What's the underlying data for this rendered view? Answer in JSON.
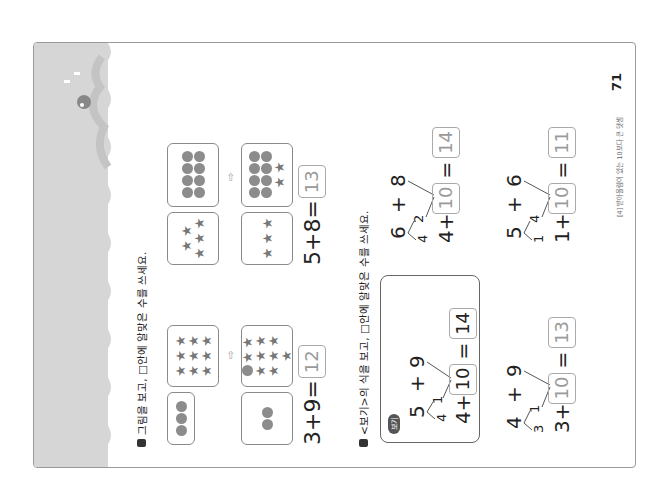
{
  "section1": {
    "instruction": "그림을 보고, □안에 알맞은 수를 쓰세요.",
    "problems": [
      {
        "left_card": {
          "dots": 3
        },
        "right_card": {
          "stars": 9
        },
        "result_left_card": {
          "dots": 2
        },
        "result_right_card": {
          "stars": 9,
          "dots": 1
        },
        "arrow": "⇨",
        "equation": "3+9=",
        "answer": "12"
      },
      {
        "left_card": {
          "stars": 5
        },
        "right_card": {
          "dots": 8
        },
        "result_left_card": {
          "stars": 3
        },
        "result_right_card": {
          "dots": 8,
          "stars": 2
        },
        "arrow": "⇨",
        "equation": "5+8=",
        "answer": "13"
      }
    ]
  },
  "section2": {
    "instruction": "<보기>의 식을 보고, □안에 알맞은 수를 쓰세요.",
    "example": {
      "badge": "보기",
      "a": "5",
      "plus": "+",
      "b": "9",
      "split1": "4",
      "split2": "1",
      "lead": "4+",
      "ten": "10",
      "equals": "=",
      "result": "14"
    },
    "problems": [
      {
        "a": "6",
        "plus": "+",
        "b": "8",
        "split1": "4",
        "split2": "2",
        "lead": "4+",
        "ten": "10",
        "equals": "=",
        "result": "14"
      },
      {
        "a": "4",
        "plus": "+",
        "b": "9",
        "split1": "3",
        "split2": "1",
        "lead": "3+",
        "ten": "10",
        "equals": "=",
        "result": "13"
      },
      {
        "a": "5",
        "plus": "+",
        "b": "6",
        "split1": "1",
        "split2": "4",
        "lead": "1+",
        "ten": "10",
        "equals": "=",
        "result": "11"
      }
    ]
  },
  "footer": {
    "chapter": "[4] 받아올림이 있는 10보다 큰 덧셈",
    "page_number": "71"
  },
  "colors": {
    "band": "#d6d6d6",
    "wave_shadow": "#c4c4c4",
    "shape": "#8c8c8c",
    "answer_text": "#9a9a9a"
  }
}
